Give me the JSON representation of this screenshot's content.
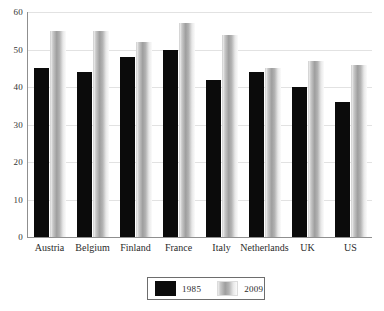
{
  "chart_data": {
    "type": "bar",
    "title": "",
    "subtitle": "",
    "xlabel": "",
    "ylabel": "",
    "ylim": [
      0,
      60
    ],
    "yticks": [
      0,
      10,
      20,
      30,
      40,
      50,
      60
    ],
    "ytick_labels": [
      "0",
      "10",
      "20",
      "30",
      "40",
      "50",
      "60"
    ],
    "grid": true,
    "legend_position": "bottom-center",
    "categories": [
      "Austria",
      "Belgium",
      "Finland",
      "France",
      "Italy",
      "Netherlands",
      "UK",
      "US"
    ],
    "series": [
      {
        "name": "1985",
        "color": "#0b0b0b",
        "values": [
          45,
          44,
          48,
          50,
          42,
          44,
          40,
          36
        ]
      },
      {
        "name": "2009",
        "color": "#b4b4b4",
        "values": [
          55,
          55,
          52,
          57,
          54,
          45,
          47,
          46
        ]
      }
    ]
  },
  "legend": {
    "entries": [
      {
        "label": "1985",
        "swatch": "black-solid-swatch"
      },
      {
        "label": "2009",
        "swatch": "gray-gradient-swatch"
      }
    ]
  },
  "colors": {
    "series_1985": "#0b0b0b",
    "series_2009": "#b4b4b4",
    "gridline": "#e2e2e2",
    "axis": "#8f8f8f",
    "text": "#2b2b2b",
    "background": "#ffffff"
  }
}
